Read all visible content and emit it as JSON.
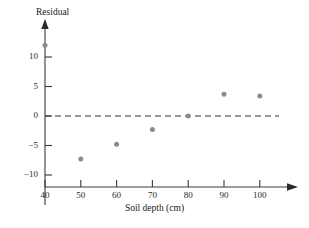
{
  "chart_data": {
    "type": "scatter",
    "title": "",
    "xlabel": "Soil depth (cm)",
    "ylabel": "Residual",
    "xlim": [
      35,
      107
    ],
    "ylim": [
      -12.5,
      13.5
    ],
    "xticks": [
      40,
      50,
      60,
      70,
      80,
      90,
      100
    ],
    "xtick_labels": [
      "40",
      "50",
      "60",
      "70",
      "80",
      "90",
      "100"
    ],
    "yticks": [
      10,
      5,
      0,
      -5,
      -10
    ],
    "ytick_labels": [
      "10",
      "5",
      "0",
      "−5",
      "−10"
    ],
    "grid": false,
    "legend": null,
    "x": [
      40,
      50,
      60,
      70,
      80,
      90,
      100
    ],
    "values": [
      12.0,
      -7.3,
      -4.8,
      -2.3,
      0.0,
      3.7,
      3.4
    ],
    "points": [
      {
        "x": 40,
        "y": 12.0
      },
      {
        "x": 50,
        "y": -7.3
      },
      {
        "x": 60,
        "y": -4.8
      },
      {
        "x": 70,
        "y": -2.3
      },
      {
        "x": 80,
        "y": 0.0
      },
      {
        "x": 90,
        "y": 3.7
      },
      {
        "x": 100,
        "y": 3.4
      }
    ],
    "reference_line": {
      "type": "horizontal",
      "y": 0,
      "style": "dashed"
    },
    "marker_color": "#8c8c8c",
    "axis_color": "#3a3a3a",
    "reference_line_color": "#333333"
  }
}
